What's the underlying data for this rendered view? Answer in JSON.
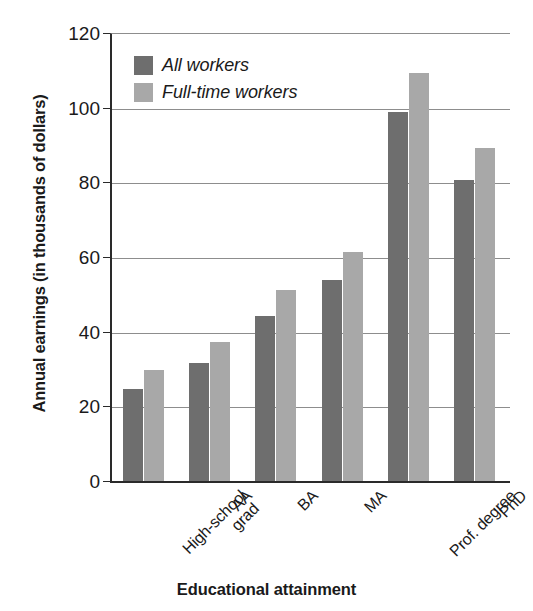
{
  "chart_data": {
    "type": "bar",
    "title": "",
    "xlabel": "Educational attainment",
    "ylabel": "Annual earnings (in thousands of dollars)",
    "categories": [
      "High-school\ngrad",
      "AA",
      "BA",
      "MA",
      "Prof. degree",
      "PhD"
    ],
    "series": [
      {
        "name": "All workers",
        "color": "#6e6e6e",
        "values": [
          25,
          32,
          44.5,
          54,
          99,
          81
        ]
      },
      {
        "name": "Full-time workers",
        "color": "#a8a8a8",
        "values": [
          30,
          37.5,
          51.5,
          61.5,
          109.5,
          89.5
        ]
      }
    ],
    "ylim": [
      0,
      120
    ],
    "yticks": [
      0,
      20,
      40,
      60,
      80,
      100,
      120
    ],
    "ytick_labels": [
      "0",
      "20",
      "40",
      "60",
      "80",
      "100",
      "120"
    ],
    "grid": true,
    "legend_position": "top-left"
  }
}
